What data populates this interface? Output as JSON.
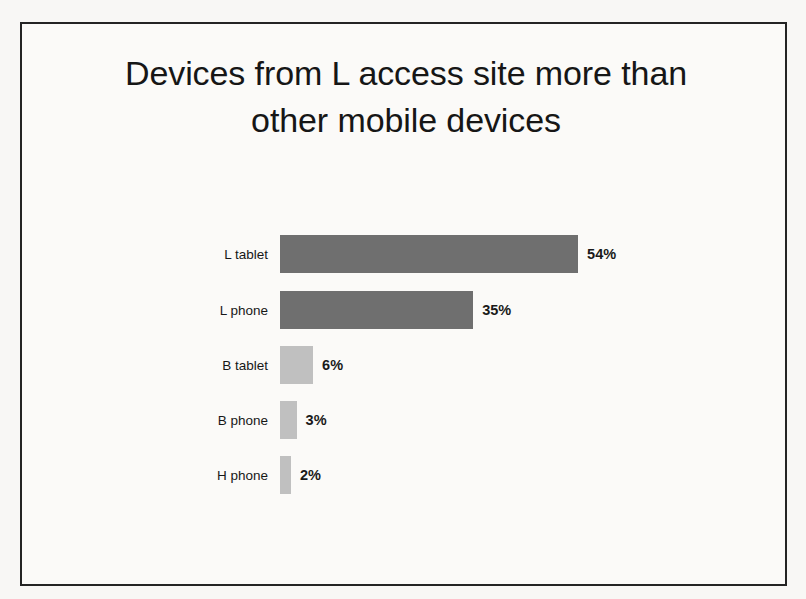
{
  "slide": {
    "title_line1": "Devices from L access site more than",
    "title_line2": "other mobile devices"
  },
  "chart_data": {
    "type": "bar",
    "orientation": "horizontal",
    "title": "Devices from L access site more than other mobile devices",
    "subtitle": "",
    "xlabel": "",
    "ylabel": "",
    "categories": [
      "L tablet",
      "L phone",
      "B tablet",
      "B phone",
      "H phone"
    ],
    "values": [
      54,
      35,
      6,
      3,
      2
    ],
    "value_labels": [
      "54%",
      "35%",
      "6%",
      "3%",
      "2%"
    ],
    "bar_colors": [
      "#6f6f6f",
      "#6f6f6f",
      "#c0c0c0",
      "#c0c0c0",
      "#c0c0c0"
    ],
    "xlim": [
      0,
      54
    ],
    "grid": false,
    "legend": false,
    "axis_visible": false,
    "units": "percent"
  },
  "colors": {
    "bar_dark": "#6f6f6f",
    "bar_light": "#c0c0c0",
    "border": "#242424",
    "text": "#161616",
    "background": "#fbfaf8"
  }
}
